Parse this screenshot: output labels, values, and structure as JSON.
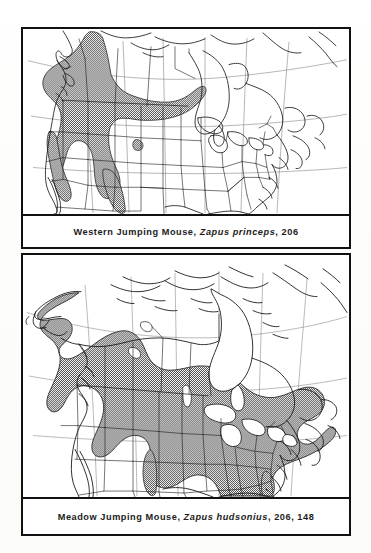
{
  "page": {
    "background_color": "#fcfcfa",
    "frame_color": "#111111",
    "shading_color": "#7f7f7f",
    "coastline_color": "#1a1a1a"
  },
  "panels": [
    {
      "id": "panel-1",
      "caption": {
        "common_name": "Western Jumping Mouse,",
        "scientific_name": "Zapus princeps",
        "comma_1": ",",
        "page_ref": "206",
        "full_text": "Western Jumping Mouse, Zapus princeps, 206"
      },
      "map": {
        "title": "Western Jumping Mouse range map",
        "region": "North America",
        "projection": "conic",
        "shaded_regions": [
          "Pacific Northwest coast",
          "British Columbia interior",
          "Yukon / northwest Alberta",
          "Rocky Mountains",
          "Great Basin ranges",
          "Sierra Nevada",
          "Colorado Rockies",
          "New Mexico mountains"
        ],
        "unshaded_note": "Great Plains, eastern North America, Arctic and eastern Canada unshaded",
        "features": [
          "coastlines",
          "provincial borders",
          "state borders",
          "graticule lines"
        ]
      }
    },
    {
      "id": "panel-2",
      "caption": {
        "common_name": "Meadow Jumping Mouse,",
        "scientific_name": "Zapus hudsonius",
        "comma_1": ",",
        "page_ref": "206",
        "comma_2": ",",
        "plate_ref": "148",
        "full_text": "Meadow Jumping Mouse, Zapus hudsonius, 206, 148"
      },
      "map": {
        "title": "Meadow Jumping Mouse range map",
        "region": "North America",
        "projection": "conic",
        "shaded_regions": [
          "Alaska interior and south-central Alaska",
          "Yukon and British Columbia",
          "Prairie provinces",
          "Ontario and Quebec",
          "Labrador and Maritimes",
          "Great Lakes states",
          "Northeastern United States",
          "Appalachians south to Georgia",
          "Upper Midwest and northern Plains",
          "Eastern Colorado / Kansas arm"
        ],
        "unshaded_note": "Arctic islands, Hudson Bay, Great Lakes water, western and southwestern United States unshaded",
        "features": [
          "coastlines",
          "provincial borders",
          "state borders",
          "graticule lines"
        ]
      }
    }
  ]
}
